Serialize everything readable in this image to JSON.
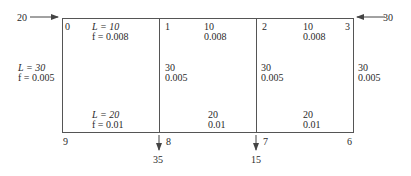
{
  "diagram": {
    "type": "pipe-network",
    "nodes": [
      {
        "id": "0",
        "label": "0"
      },
      {
        "id": "1",
        "label": "1"
      },
      {
        "id": "2",
        "label": "2"
      },
      {
        "id": "3",
        "label": "3"
      },
      {
        "id": "6",
        "label": "6"
      },
      {
        "id": "7",
        "label": "7"
      },
      {
        "id": "8",
        "label": "8"
      },
      {
        "id": "9",
        "label": "9"
      }
    ],
    "flows": {
      "inflow_left": {
        "node": "0",
        "value": "20"
      },
      "inflow_right": {
        "node": "3",
        "value": "30"
      },
      "outflow_8": {
        "node": "8",
        "value": "35"
      },
      "outflow_7": {
        "node": "7",
        "value": "15"
      }
    },
    "pipes": {
      "top_0_1": {
        "L_label": "L = 10",
        "f_label": "f = 0.008"
      },
      "top_1_2": {
        "L": "10",
        "f": "0.008"
      },
      "top_2_3": {
        "L": "10",
        "f": "0.008"
      },
      "left_0_9": {
        "L_label": "L = 30",
        "f_label": "f = 0.005"
      },
      "mid_1_8": {
        "L": "30",
        "f": "0.005"
      },
      "mid_2_7": {
        "L": "30",
        "f": "0.005"
      },
      "right_3_6": {
        "L": "30",
        "f": "0.005"
      },
      "bottom_9_8": {
        "L_label": "L = 20",
        "f_label": "f = 0.01"
      },
      "bottom_8_7": {
        "L": "20",
        "f": "0.01"
      },
      "bottom_7_6": {
        "L": "20",
        "f": "0.01"
      }
    }
  }
}
